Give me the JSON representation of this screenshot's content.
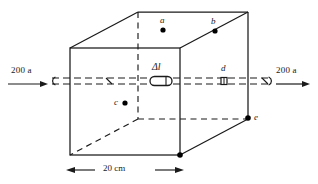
{
  "figure": {
    "colors": {
      "stroke": "#1a1a1a",
      "background": "#ffffff",
      "marker": "#000000"
    },
    "labels": {
      "current_left": "200 a",
      "current_right": "200 a",
      "element": "Δl",
      "dimension": "20 cm",
      "point_a": "a",
      "point_b": "b",
      "point_c": "c",
      "point_d": "d",
      "point_e": "e"
    },
    "geometry": {
      "front_face": {
        "left": 70,
        "right": 180,
        "top": 48,
        "bottom": 155
      },
      "depth_offset": {
        "dx": 68,
        "dy": -36
      },
      "wire_y": 81,
      "wire_x_start": 8,
      "wire_x_end": 310
    },
    "markers": [
      {
        "name": "point-a",
        "x": 163,
        "y": 30,
        "label": "a",
        "label_dx": -2,
        "label_dy": -12
      },
      {
        "name": "point-b",
        "x": 215,
        "y": 31,
        "label": "b",
        "label_dx": -3,
        "label_dy": -13
      },
      {
        "name": "point-c",
        "x": 125,
        "y": 103,
        "label": "c",
        "label_dx": -10,
        "label_dy": -4
      },
      {
        "name": "point-d",
        "x": 224,
        "y": 84,
        "label": "d",
        "label_dx": -2,
        "label_dy": -13
      },
      {
        "name": "point-e",
        "x": 248,
        "y": 118,
        "label": "e",
        "label_dx": 5,
        "label_dy": -3
      },
      {
        "name": "vertex-front-bottom-right",
        "x": 180,
        "y": 155,
        "label": "",
        "label_dx": 0,
        "label_dy": 0
      }
    ]
  }
}
